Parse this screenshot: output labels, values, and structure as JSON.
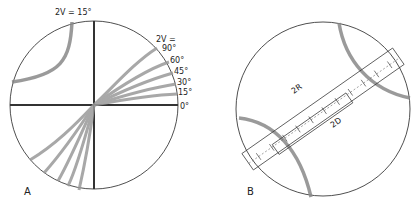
{
  "figure": {
    "panel_a": {
      "label": "A",
      "top_label": "2V = 15°",
      "right_header": "2V =",
      "angle_labels": [
        "90°",
        "60°",
        "45°",
        "30°",
        "15°",
        "0°"
      ]
    },
    "panel_b": {
      "label": "B",
      "label_2r": "2R",
      "label_2d": "2D"
    }
  }
}
